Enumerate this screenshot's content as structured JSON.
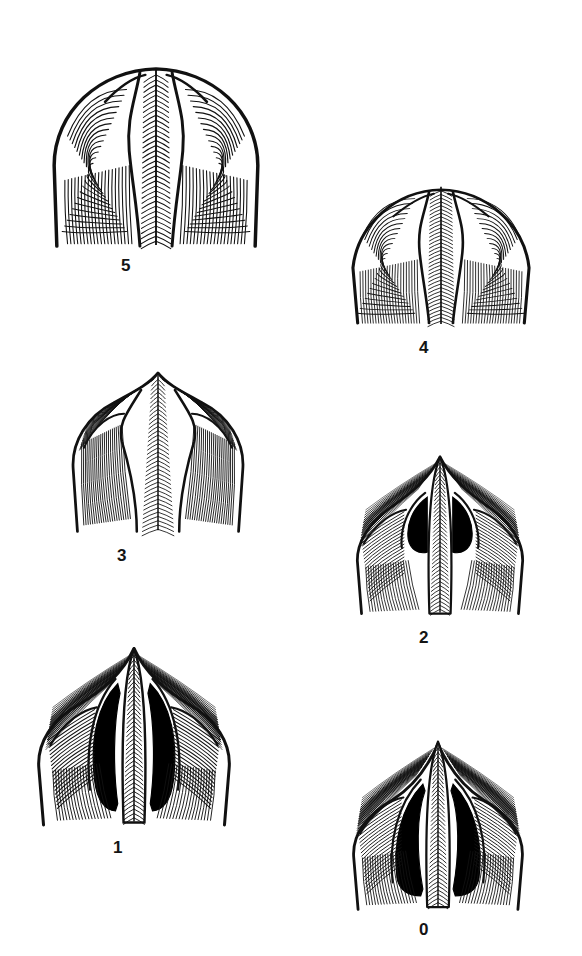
{
  "plate": {
    "title": "Morphological wear-stage series",
    "background_color": "#ffffff",
    "ink_color": "#111111",
    "fill_color": "#000000",
    "width": 582,
    "height": 956,
    "specimen_count": 6
  },
  "figures": [
    {
      "label": "5",
      "stage": 5,
      "x": 22,
      "y": 48,
      "w": 268,
      "h": 208,
      "caption_x": 126,
      "caption_y": 256,
      "outline": "broad rounded bilobed crown, widest of series",
      "median_opening": "closed",
      "opening_area": 0,
      "apex": "rounded, shallow median notch",
      "lateral_lobes": "full, strongly convex shoulders",
      "hatch_density": "dense concentric",
      "ridge": "narrow median ridge, parallel flanks"
    },
    {
      "label": "4",
      "stage": 4,
      "x": 322,
      "y": 165,
      "w": 238,
      "h": 168,
      "caption_x": 424,
      "caption_y": 338,
      "outline": "rounded crown, slightly narrower shoulders",
      "median_opening": "closed",
      "opening_area": 0,
      "apex": "low rounded peak",
      "lateral_lobes": "convex, sloping shoulders",
      "hatch_density": "fine parallel striations",
      "ridge": "median ridge with herringbone striae"
    },
    {
      "label": "3",
      "stage": 3,
      "x": 52,
      "y": 358,
      "w": 212,
      "h": 182,
      "caption_x": 122,
      "caption_y": 546,
      "outline": "crown with pointed apex, narrowing median field",
      "median_opening": "closed",
      "opening_area": 0,
      "apex": "pointed",
      "lateral_lobes": "angular shoulders, flaring",
      "hatch_density": "medium fanning",
      "ridge": "broad tapering median ridge"
    },
    {
      "label": "2",
      "stage": 2,
      "x": 334,
      "y": 442,
      "w": 212,
      "h": 180,
      "caption_x": 424,
      "caption_y": 628,
      "outline": "sharply peaked crown, open median area",
      "median_opening": "two small lenticular black slits",
      "opening_area": 1,
      "apex": "sharply pointed",
      "lateral_lobes": "winged, drawn outward",
      "hatch_density": "fanning from ridge",
      "ridge": "narrow ridge with herringbone striae"
    },
    {
      "label": "1",
      "stage": 1,
      "x": 18,
      "y": 632,
      "w": 232,
      "h": 200,
      "caption_x": 118,
      "caption_y": 838,
      "outline": "peaked crown with elongate median openings",
      "median_opening": "two long crescentic black slits",
      "opening_area": 2,
      "apex": "sharply pointed, narrow",
      "lateral_lobes": "broad winged flanks",
      "hatch_density": "long sweeping fans",
      "ridge": "slender ridge, full length herringbone"
    },
    {
      "label": "0",
      "stage": 0,
      "x": 330,
      "y": 726,
      "w": 216,
      "h": 190,
      "caption_x": 424,
      "caption_y": 920,
      "outline": "most open crown, widest median cavities",
      "median_opening": "two large triangular black cavities",
      "opening_area": 3,
      "apex": "sharply pointed, tall",
      "lateral_lobes": "strongly winged, concave flanks",
      "hatch_density": "open fanning",
      "ridge": "slender ridge, prominent herringbone"
    }
  ]
}
